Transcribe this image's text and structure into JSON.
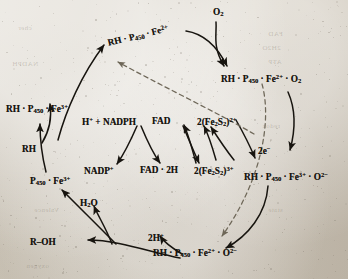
{
  "diagram": {
    "ink_color": "#17140f",
    "paper_color": "#cfc8bb",
    "dashed_arrow_color": "#6e6758",
    "labels": [
      {
        "id": "rh-p450-fe2",
        "text": "RH · P450 · Fe2+",
        "x": 108,
        "y": 38,
        "rotated": true
      },
      {
        "id": "o2-top",
        "text": "O2",
        "x": 213,
        "y": 8,
        "rotated": false
      },
      {
        "id": "rh-p450-fe2-o2",
        "text": "RH · P450 · Fe2+ · O2",
        "x": 221,
        "y": 74,
        "rotated": false
      },
      {
        "id": "rh-p450-fe3",
        "text": "RH · P450 · Fe3+",
        "x": 6,
        "y": 104,
        "rotated": false
      },
      {
        "id": "rh-substrate",
        "text": "RH",
        "x": 22,
        "y": 145,
        "rotated": false
      },
      {
        "id": "p450-fe3",
        "text": "P450 · Fe3+",
        "x": 30,
        "y": 176,
        "rotated": false
      },
      {
        "id": "h-nadph",
        "text": "H+ + NADPH",
        "x": 82,
        "y": 117,
        "rotated": false
      },
      {
        "id": "nadp-plus",
        "text": "NADP+",
        "x": 84,
        "y": 166,
        "rotated": false
      },
      {
        "id": "fad",
        "text": "FAD",
        "x": 152,
        "y": 117,
        "rotated": false
      },
      {
        "id": "fad-2h",
        "text": "FAD · 2H",
        "x": 140,
        "y": 166,
        "rotated": false
      },
      {
        "id": "fe2s2-2plus",
        "text": "2(Fe2S2)2+",
        "x": 197,
        "y": 117,
        "rotated": false
      },
      {
        "id": "fe2s2-3plus",
        "text": "2(Fe2S2)3+",
        "x": 194,
        "y": 166,
        "rotated": false
      },
      {
        "id": "two-electrons",
        "text": "2e−",
        "x": 258,
        "y": 146,
        "rotated": false
      },
      {
        "id": "rh-p450-fe3-superox",
        "text": "RH · P450 · Fe3+ · O2−",
        "x": 244,
        "y": 172,
        "rotated": false
      },
      {
        "id": "water",
        "text": "H2O",
        "x": 80,
        "y": 199,
        "rotated": false
      },
      {
        "id": "two-protons",
        "text": "2H+",
        "x": 148,
        "y": 233,
        "rotated": false
      },
      {
        "id": "r-oh-product",
        "text": "R–OH",
        "x": 30,
        "y": 238,
        "rotated": false
      },
      {
        "id": "rh-p450-fe2-superox",
        "text": "RH · P450 · Fe2+ · O2−",
        "x": 153,
        "y": 248,
        "rotated": false
      }
    ],
    "bleed_text": [
      {
        "text": "NADPH",
        "x": 12,
        "y": 60
      },
      {
        "text": "FAD",
        "x": 268,
        "y": 30
      },
      {
        "text": "2H2O",
        "x": 262,
        "y": 44
      },
      {
        "text": "ATP",
        "x": 268,
        "y": 58
      },
      {
        "text": "cher",
        "x": 18,
        "y": 24
      },
      {
        "text": "Valence",
        "x": 34,
        "y": 206
      },
      {
        "text": "redox",
        "x": 262,
        "y": 122
      },
      {
        "text": "state",
        "x": 268,
        "y": 206
      },
      {
        "text": "oxygen",
        "x": 26,
        "y": 262
      }
    ]
  }
}
